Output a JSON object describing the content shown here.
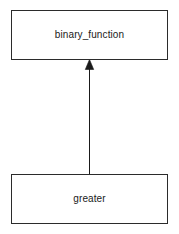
{
  "diagram": {
    "type": "uml-class-inheritance",
    "canvas": {
      "width": 179,
      "height": 234,
      "background_color": "#ffffff"
    },
    "style": {
      "node_fill": "#ffffff",
      "node_border_color": "#2b2b2b",
      "node_border_width": 1,
      "edge_color": "#1a1a1a",
      "edge_width": 1,
      "text_color": "#1a1a1a",
      "font_size": 10
    },
    "nodes": [
      {
        "id": "binary_function",
        "label": "binary_function",
        "role": "base-class",
        "x": 11,
        "y": 10,
        "width": 157,
        "height": 50
      },
      {
        "id": "greater",
        "label": "greater",
        "role": "derived-class",
        "x": 11,
        "y": 174,
        "width": 157,
        "height": 50
      }
    ],
    "edges": [
      {
        "id": "greater-inherits-binary_function",
        "from": "greater",
        "to": "binary_function",
        "relationship": "generalization",
        "arrowhead": "closed-filled-triangle",
        "line_style": "solid",
        "x": 89.5,
        "y_start": 174,
        "y_end": 60
      }
    ]
  }
}
